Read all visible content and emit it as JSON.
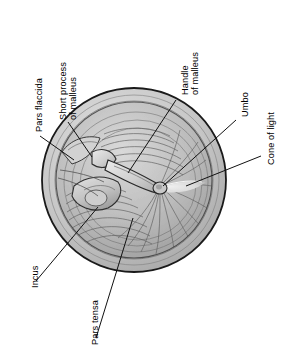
{
  "figure": {
    "orientation": "labels-rotated-90-ccw",
    "colors": {
      "background": "#ffffff",
      "outline": "#1a1a1a",
      "membrane_light": "#d8d8d8",
      "membrane_mid": "#b4b4b4",
      "membrane_dark": "#8e8e8e",
      "rim": "#c3c3c3",
      "cone_of_light": "#ececec",
      "leader_line": "#111111",
      "label_text": "#000000"
    },
    "circle": {
      "cx": 134,
      "cy": 180,
      "r": 92
    }
  },
  "labels": [
    {
      "id": "pars-flaccida",
      "text": "Pars flaccida",
      "lines": [
        "Pars flaccida"
      ],
      "x": 34,
      "y": 132,
      "leader": {
        "x1": 40,
        "y1": 136,
        "x2": 74,
        "y2": 160
      }
    },
    {
      "id": "short-process-malleus",
      "text": "Short process of malleus",
      "lines": [
        "Short process",
        "of malleus"
      ],
      "x": 58,
      "y": 120,
      "leader": {
        "x1": 68,
        "y1": 122,
        "x2": 92,
        "y2": 157
      }
    },
    {
      "id": "handle-of-malleus",
      "text": "Handle of malleus",
      "lines": [
        "Handle",
        "of malleus"
      ],
      "x": 180,
      "y": 95,
      "leader": {
        "x1": 176,
        "y1": 100,
        "x2": 128,
        "y2": 173
      }
    },
    {
      "id": "umbo",
      "text": "Umbo",
      "lines": [
        "Umbo"
      ],
      "x": 240,
      "y": 117,
      "leader": {
        "x1": 236,
        "y1": 120,
        "x2": 163,
        "y2": 186
      }
    },
    {
      "id": "cone-of-light",
      "text": "Cone of light",
      "lines": [
        "Cone of light"
      ],
      "x": 266,
      "y": 165,
      "leader": {
        "x1": 261,
        "y1": 156,
        "x2": 186,
        "y2": 186
      }
    },
    {
      "id": "incus",
      "text": "Incus",
      "lines": [
        "Incus"
      ],
      "x": 30,
      "y": 288,
      "leader": {
        "x1": 36,
        "y1": 281,
        "x2": 98,
        "y2": 207
      }
    },
    {
      "id": "pars-tensa",
      "text": "Pars tensa",
      "lines": [
        "Pars tensa"
      ],
      "x": 90,
      "y": 345,
      "leader": {
        "x1": 96,
        "y1": 338,
        "x2": 133,
        "y2": 218
      }
    }
  ]
}
